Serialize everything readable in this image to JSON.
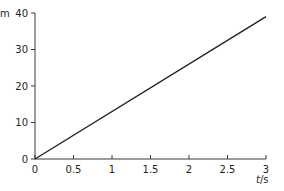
{
  "chart_data": {
    "type": "line",
    "title": "",
    "xlabel": "t/s",
    "ylabel": "m",
    "xlim": [
      0,
      3
    ],
    "ylim": [
      0,
      40
    ],
    "x_ticks": [
      "0",
      "0.5",
      "1",
      "1.5",
      "2",
      "2.5",
      "3"
    ],
    "y_ticks": [
      "0",
      "10",
      "20",
      "30",
      "40"
    ],
    "grid": false,
    "legend": null,
    "series": [
      {
        "name": "distance",
        "x": [
          0,
          3
        ],
        "y": [
          0,
          39
        ],
        "color": "#231f20"
      }
    ]
  }
}
